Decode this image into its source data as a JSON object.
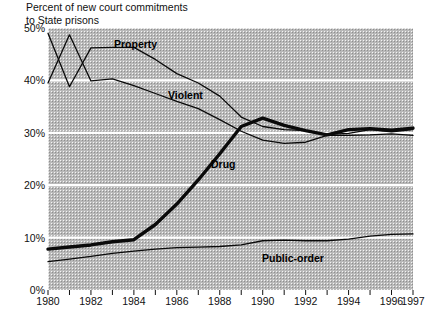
{
  "title": {
    "line1": "Percent of new court commitments",
    "line2": "to State prisons"
  },
  "axes": {
    "y_ticks": [
      "0%",
      "10%",
      "20%",
      "30%",
      "40%",
      "50%"
    ],
    "x_ticks": [
      "1980",
      "1982",
      "1984",
      "1986",
      "1988",
      "1990",
      "1992",
      "1994",
      "1996",
      "1997"
    ]
  },
  "labels": {
    "property": "Property",
    "violent": "Violent",
    "drug": "Drug",
    "public_order": "Public-order"
  },
  "chart_data": {
    "type": "line",
    "title": "Percent of new court commitments to State prisons",
    "xlabel": "",
    "ylabel": "Percent of new court commitments to State prisons",
    "xlim": [
      1980,
      1997
    ],
    "ylim": [
      0,
      50
    ],
    "yticks": [
      0,
      10,
      20,
      30,
      40,
      50
    ],
    "ytick_labels": [
      "0%",
      "10%",
      "20%",
      "30%",
      "40%",
      "50%"
    ],
    "xticks": [
      1980,
      1982,
      1984,
      1986,
      1988,
      1990,
      1992,
      1994,
      1996,
      1997
    ],
    "grid": "horizontal-white",
    "legend": "inline-labels",
    "x": [
      1980,
      1981,
      1982,
      1983,
      1984,
      1985,
      1986,
      1987,
      1988,
      1989,
      1990,
      1991,
      1992,
      1993,
      1994,
      1995,
      1996,
      1997
    ],
    "series": [
      {
        "name": "Property",
        "style": "thin",
        "values": [
          49.0,
          38.8,
          46.2,
          46.3,
          46.3,
          44.0,
          41.3,
          39.5,
          37.0,
          33.0,
          31.2,
          30.6,
          30.4,
          29.7,
          29.9,
          30.6,
          30.2,
          30.6
        ]
      },
      {
        "name": "Violent",
        "style": "thin",
        "values": [
          39.5,
          48.7,
          39.9,
          40.3,
          39.0,
          37.5,
          36.0,
          34.6,
          32.5,
          30.3,
          28.6,
          28.0,
          28.2,
          29.5,
          29.5,
          29.6,
          29.8,
          29.5
        ]
      },
      {
        "name": "Drug",
        "style": "thick",
        "values": [
          7.8,
          8.2,
          8.6,
          9.2,
          9.6,
          12.5,
          16.4,
          21.0,
          26.0,
          31.2,
          32.8,
          31.4,
          30.4,
          29.6,
          30.6,
          30.8,
          30.5,
          30.9
        ]
      },
      {
        "name": "Public-order",
        "style": "thin",
        "values": [
          5.4,
          5.9,
          6.4,
          7.0,
          7.4,
          7.8,
          8.1,
          8.2,
          8.3,
          8.6,
          9.4,
          9.5,
          9.4,
          9.4,
          9.7,
          10.3,
          10.6,
          10.7
        ]
      }
    ]
  }
}
